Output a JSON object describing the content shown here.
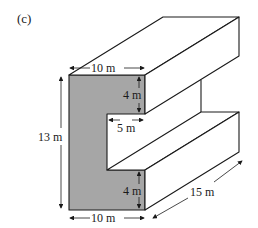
{
  "figure_label": "(c)",
  "shape": "C-shaped prism",
  "colors": {
    "front_face": "#a6a6a6",
    "stroke": "#1a1a1a"
  },
  "dimensions": {
    "top_width": "10 m",
    "top_notch_height": "4 m",
    "notch_depth": "5 m",
    "total_height": "13 m",
    "bottom_notch_height": "4 m",
    "bottom_width": "10 m",
    "length": "15 m"
  }
}
